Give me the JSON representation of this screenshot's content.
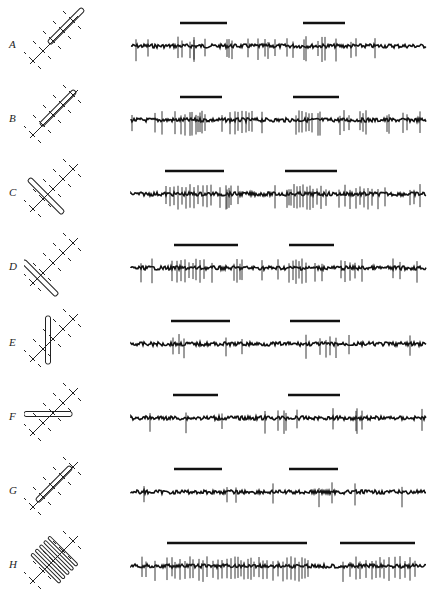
{
  "figure": {
    "panels": [
      {
        "label": "A",
        "bar_orientation_deg": 45,
        "bars": [
          [
            180,
            227
          ],
          [
            303,
            345
          ]
        ],
        "spikes": [
          136,
          148,
          178,
          182,
          190,
          194,
          194,
          205,
          227,
          229,
          232,
          248,
          258,
          265,
          268,
          275,
          287,
          293,
          304,
          306,
          318,
          322,
          325,
          336,
          351,
          356,
          375
        ]
      },
      {
        "label": "B",
        "bar_orientation_deg": 45,
        "bars": [
          [
            180,
            222
          ],
          [
            293,
            339
          ]
        ],
        "spikes": [
          132,
          155,
          162,
          175,
          181,
          185,
          190,
          192,
          196,
          198,
          200,
          202,
          205,
          222,
          230,
          235,
          238,
          242,
          246,
          249,
          252,
          262,
          296,
          299,
          302,
          306,
          309,
          312,
          318,
          320,
          340,
          344,
          349,
          360,
          363,
          366,
          387,
          389,
          403,
          407,
          420
        ]
      },
      {
        "label": "C",
        "bar_orientation_deg": -45,
        "bars": [
          [
            165,
            224
          ],
          [
            285,
            337
          ]
        ],
        "spikes": [
          166,
          170,
          174,
          178,
          182,
          186,
          190,
          194,
          198,
          203,
          207,
          211,
          220,
          226,
          227,
          229,
          231,
          238,
          275,
          287,
          289,
          291,
          294,
          297,
          300,
          303,
          307,
          310,
          313,
          317,
          321,
          326,
          339,
          345,
          350,
          356,
          360,
          364,
          368,
          372,
          378,
          385,
          410,
          414,
          420
        ]
      },
      {
        "label": "D",
        "bar_orientation_deg": -45,
        "bars": [
          [
            174,
            238
          ],
          [
            289,
            334
          ]
        ],
        "spikes": [
          141,
          152,
          172,
          177,
          181,
          185,
          189,
          193,
          196,
          200,
          204,
          212,
          234,
          237,
          240,
          242,
          262,
          278,
          289,
          293,
          296,
          299,
          302,
          306,
          315,
          322,
          341,
          345,
          350,
          355,
          362,
          393,
          400,
          417
        ]
      },
      {
        "label": "E",
        "bar_orientation_deg": 90,
        "bars": [
          [
            171,
            230
          ],
          [
            290,
            340
          ]
        ],
        "spikes": [
          173,
          179,
          184,
          226,
          242,
          306,
          320,
          326,
          330,
          336,
          349,
          410
        ]
      },
      {
        "label": "F",
        "bar_orientation_deg": 0,
        "bars": [
          [
            173,
            218
          ],
          [
            288,
            340
          ]
        ],
        "spikes": [
          150,
          186,
          222,
          265,
          278,
          284,
          286,
          297,
          333,
          356,
          357,
          362,
          422
        ]
      },
      {
        "label": "G",
        "bar_orientation_deg": 45,
        "bars": [
          [
            174,
            222
          ],
          [
            289,
            338
          ]
        ],
        "spikes": [
          144,
          227,
          236,
          273,
          319,
          332,
          355,
          402
        ]
      },
      {
        "label": "H",
        "bar_orientation_deg": 45,
        "bars": [
          [
            167,
            307
          ],
          [
            340,
            415
          ]
        ],
        "spikes": [
          142,
          146,
          155,
          167,
          172,
          175,
          180,
          185,
          190,
          193,
          199,
          203,
          207,
          213,
          218,
          222,
          227,
          231,
          235,
          238,
          241,
          244,
          248,
          251,
          254,
          259,
          263,
          267,
          273,
          278,
          283,
          287,
          291,
          295,
          299,
          302,
          305,
          308,
          343,
          350,
          356,
          360,
          366,
          372,
          376,
          380,
          384,
          389,
          395,
          400,
          405,
          410,
          415
        ]
      }
    ]
  }
}
